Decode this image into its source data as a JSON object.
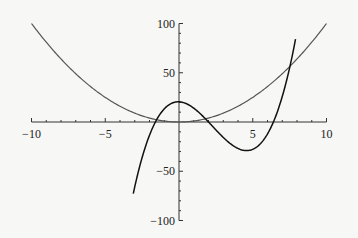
{
  "chart_data": {
    "type": "line",
    "title": "",
    "xlabel": "",
    "ylabel": "",
    "xlim": [
      -10,
      10
    ],
    "ylim": [
      -100,
      100
    ],
    "grid": false,
    "x_ticks": [
      -10,
      -5,
      5,
      10
    ],
    "y_ticks": [
      100,
      50,
      -50,
      -100
    ],
    "x_tick_labels": [
      "−10",
      "−5",
      "5",
      "10"
    ],
    "y_tick_labels": [
      "100",
      "50",
      "−50",
      "−100"
    ],
    "series": [
      {
        "name": "parabola",
        "formula": "x^2",
        "color": "#555555",
        "x": [
          -10,
          -8,
          -6,
          -4,
          -2,
          0,
          2,
          4,
          6,
          8,
          10
        ],
        "values": [
          100,
          64,
          36,
          16,
          4,
          0,
          4,
          16,
          36,
          64,
          100
        ]
      },
      {
        "name": "cubic",
        "formula": "(x+1.6)(x-2)(x-6.4)",
        "color": "#111111",
        "x": [
          -3.1,
          -2,
          -1,
          0,
          1,
          2,
          3,
          4.4,
          5,
          6,
          7,
          7.9
        ],
        "values": [
          -97,
          -38,
          5,
          20,
          15,
          0,
          -16,
          -29,
          -25,
          -16,
          5,
          87
        ]
      }
    ]
  }
}
